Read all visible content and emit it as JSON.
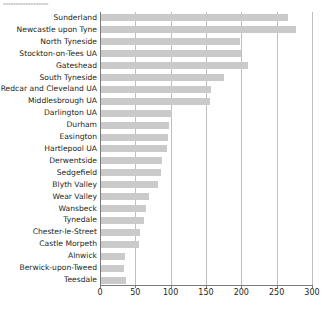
{
  "top_fragment": "▪▪▪▪▪▪▪▪▪▪▪▪▪▪▪▪▪▪",
  "chart_data": {
    "type": "bar",
    "orientation": "horizontal",
    "title": "",
    "xlabel": "",
    "ylabel": "",
    "xlim": [
      0,
      300
    ],
    "xticks": [
      0,
      50,
      100,
      150,
      200,
      250,
      300
    ],
    "grid": true,
    "grid_axis": "x",
    "legend": false,
    "bar_color": "#cacaca",
    "axis_color": "#7a7a7a",
    "gridline_color": "#bfbfbf",
    "text_color": "#231f20",
    "categories": [
      "Sunderland",
      "Newcastle upon Tyne",
      "North Tyneside",
      "Stockton-on-Tees UA",
      "Gateshead",
      "South Tyneside",
      "Redcar and Cleveland UA",
      "Middlesbrough UA",
      "Darlington UA",
      "Durham",
      "Easington",
      "Hartlepool UA",
      "Derwentside",
      "Sedgefield",
      "Blyth Valley",
      "Wear Valley",
      "Wansbeck",
      "Tynedale",
      "Chester-le-Street",
      "Castle Morpeth",
      "Alnwick",
      "Berwick-upon-Tweed",
      "Teesdale"
    ],
    "values": [
      266,
      278,
      198,
      200,
      209,
      175,
      157,
      155,
      102,
      98,
      96,
      95,
      88,
      86,
      82,
      69,
      65,
      62,
      57,
      55,
      36,
      34,
      37
    ]
  }
}
